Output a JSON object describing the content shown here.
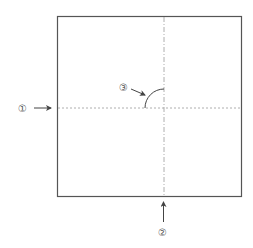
{
  "diagram": {
    "type": "origami-fold-step",
    "colors": {
      "outline": "#555555",
      "fold_line": "#999999",
      "arc": "#444444",
      "arrow": "#444444",
      "label": "#555555"
    },
    "square": {
      "x": 57,
      "y": 16,
      "width": 184,
      "height": 180
    },
    "horizontal_fold": {
      "style": "dashed",
      "y": 108,
      "label": "①"
    },
    "vertical_fold": {
      "style": "dash-dot",
      "x": 164,
      "label": "②"
    },
    "arc_annotation": {
      "label": "③",
      "center": [
        164,
        108
      ],
      "radius": 19
    }
  },
  "labels": {
    "one": "①",
    "two": "②",
    "three": "③"
  }
}
